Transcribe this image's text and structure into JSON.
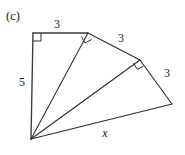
{
  "figure": {
    "part_label": "(c)",
    "background_color": "#ffffff",
    "stroke_color": "#2b2b2b",
    "width": 185,
    "height": 155,
    "vertices": {
      "apex": {
        "name": "apex",
        "x": 31,
        "y": 139
      },
      "top_left": {
        "name": "top-left",
        "x": 33,
        "y": 33
      },
      "second": {
        "name": "second",
        "x": 88,
        "y": 33
      },
      "third": {
        "name": "third",
        "x": 140,
        "y": 60
      },
      "far_right": {
        "name": "far-right",
        "x": 172,
        "y": 104
      }
    },
    "segments": [
      {
        "name": "vertical-leg-5",
        "from": "apex",
        "to": "top_left",
        "label": "5"
      },
      {
        "name": "top-leg-3",
        "from": "top_left",
        "to": "second",
        "label": "3"
      },
      {
        "name": "hypotenuse-1",
        "from": "apex",
        "to": "second",
        "label": ""
      },
      {
        "name": "leg-3-second",
        "from": "second",
        "to": "third",
        "label": "3"
      },
      {
        "name": "hypotenuse-2",
        "from": "apex",
        "to": "third",
        "label": ""
      },
      {
        "name": "leg-3-third",
        "from": "third",
        "to": "far_right",
        "label": "3"
      },
      {
        "name": "hypotenuse-x",
        "from": "apex",
        "to": "far_right",
        "label": "x"
      }
    ],
    "right_angles": [
      {
        "name": "right-angle-top-left",
        "at": "top_left"
      },
      {
        "name": "right-angle-second",
        "at": "second"
      },
      {
        "name": "right-angle-third",
        "at": "third"
      }
    ],
    "labels": [
      {
        "name": "label-5",
        "text": "5",
        "x": 22,
        "y": 82,
        "italic": false
      },
      {
        "name": "label-3-top",
        "text": "3",
        "x": 57,
        "y": 24,
        "italic": false
      },
      {
        "name": "label-3-middle",
        "text": "3",
        "x": 121,
        "y": 38,
        "italic": false
      },
      {
        "name": "label-3-right",
        "text": "3",
        "x": 167,
        "y": 73,
        "italic": false
      },
      {
        "name": "label-x",
        "text": "x",
        "x": 105,
        "y": 133,
        "italic": true
      }
    ]
  }
}
